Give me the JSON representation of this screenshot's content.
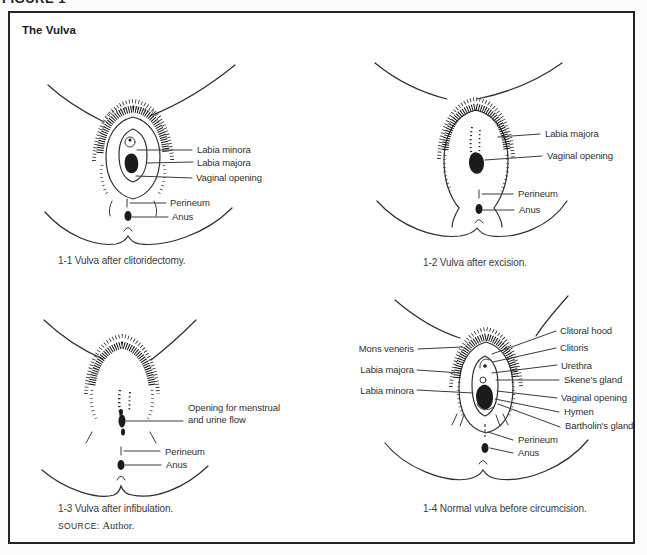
{
  "page": {
    "figure_tag": "FIGURE 1",
    "title": "The Vulva",
    "source_label": "SOURCE:",
    "source_value": "Author."
  },
  "panels": [
    {
      "id": "1-1",
      "caption": "1-1 Vulva after clitoridectomy.",
      "labels": [
        "Labia minora",
        "Labia majora",
        "Vaginal opening",
        "Perineum",
        "Anus"
      ]
    },
    {
      "id": "1-2",
      "caption": "1-2 Vulva after excision.",
      "labels": [
        "Labia majora",
        "Vaginal opening",
        "Perineum",
        "Anus"
      ]
    },
    {
      "id": "1-3",
      "caption": "1-3 Vulva after infibulation.",
      "labels": [
        "Opening for menstrual and urine flow",
        "Perineum",
        "Anus"
      ]
    },
    {
      "id": "1-4",
      "caption": "1-4 Normal vulva before circumcision.",
      "labels_left": [
        "Mons veneris",
        "Labia majora",
        "Labia minora"
      ],
      "labels_right": [
        "Clitoral hood",
        "Clitoris",
        "Urethra",
        "Skene's gland",
        "Vaginal opening",
        "Hymen",
        "Bartholin's gland",
        "Perineum",
        "Anus"
      ]
    }
  ],
  "colors": {
    "ink": "#2e2e2e",
    "text": "#333333",
    "background": "#ffffff"
  }
}
